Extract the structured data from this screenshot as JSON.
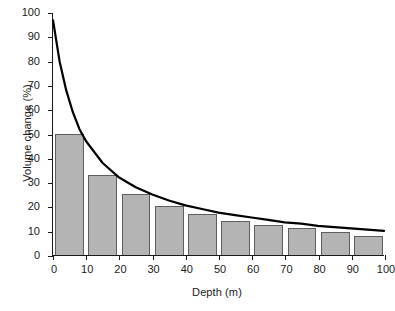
{
  "chart_data": {
    "type": "bar",
    "title": "",
    "subtitle": "",
    "xlabel": "Depth (m)",
    "ylabel": "Volume change (%)",
    "xlim": [
      0,
      100
    ],
    "ylim": [
      0,
      100
    ],
    "xticks": [
      0,
      10,
      20,
      30,
      40,
      50,
      60,
      70,
      80,
      90,
      100
    ],
    "yticks": [
      0,
      10,
      20,
      30,
      40,
      50,
      60,
      70,
      80,
      90,
      100
    ],
    "grid": false,
    "legend": null,
    "bar_color": "#b4b4b4",
    "bar_edge_color": "#5e5e5e",
    "curve_color": "#000000",
    "categories": [
      "0-10",
      "10-20",
      "20-30",
      "30-40",
      "40-50",
      "50-60",
      "60-70",
      "70-80",
      "80-90",
      "90-100"
    ],
    "bin_edges": [
      0,
      10,
      20,
      30,
      40,
      50,
      60,
      70,
      80,
      90,
      100
    ],
    "values": [
      50,
      33,
      25,
      20,
      17,
      14,
      12.5,
      11,
      9.5,
      8
    ],
    "series": [
      {
        "name": "Volume change per 10 m interval",
        "type": "bar",
        "values": [
          50,
          33,
          25,
          20,
          17,
          14,
          12.5,
          11,
          9.5,
          8
        ]
      },
      {
        "name": "Cumulative decay curve",
        "type": "line",
        "x": [
          0,
          2,
          4,
          6,
          8,
          10,
          15,
          20,
          25,
          30,
          35,
          40,
          45,
          50,
          55,
          60,
          65,
          70,
          75,
          80,
          85,
          90,
          95,
          100
        ],
        "y": [
          97,
          80,
          68,
          59,
          52,
          47,
          38,
          32,
          28,
          25,
          22.5,
          20.5,
          19,
          17.5,
          16.5,
          15.5,
          14.5,
          13.5,
          13,
          12,
          11.5,
          11,
          10.5,
          10
        ]
      }
    ]
  },
  "axes": {
    "x_title": "Depth (m)",
    "y_title": "Volume change (%)"
  }
}
